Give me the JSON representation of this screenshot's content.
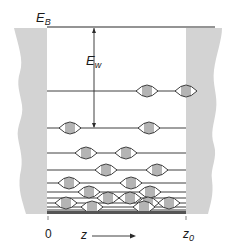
{
  "figure": {
    "labels": {
      "barrier_energy": {
        "main": "E",
        "sub": "B"
      },
      "well_depth": {
        "main": "E",
        "sub": "w"
      },
      "origin": "0",
      "axis_variable": "z",
      "end_position": {
        "main": "z",
        "sub": "0"
      }
    },
    "colors": {
      "wall": "#d3d3d3",
      "line": "#2a2a2a",
      "background": "#ffffff"
    },
    "well": {
      "left_x": 47,
      "right_x": 186,
      "top_y": 27,
      "bottom_y": 214
    },
    "energy_levels_y": [
      27,
      91,
      128,
      153,
      170,
      183,
      192,
      198,
      203,
      207,
      210,
      212
    ],
    "wave_packets": [
      {
        "level_y": 91,
        "x": [
          147,
          186
        ]
      },
      {
        "level_y": 128,
        "x": [
          70,
          149
        ]
      },
      {
        "level_y": 153,
        "x": [
          86,
          126
        ]
      },
      {
        "level_y": 170,
        "x": [
          106,
          157
        ]
      },
      {
        "level_y": 183,
        "x": [
          69,
          131
        ]
      },
      {
        "level_y": 192,
        "x": [
          89,
          150
        ]
      },
      {
        "level_y": 198,
        "x": [
          108,
          130
        ]
      },
      {
        "level_y": 203,
        "x": [
          66,
          148,
          169
        ]
      },
      {
        "level_y": 207,
        "x": [
          92,
          144
        ]
      }
    ],
    "arrow_well_depth": {
      "x": 94,
      "from_y": 27,
      "to_y": 128
    }
  }
}
